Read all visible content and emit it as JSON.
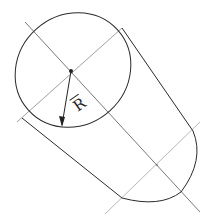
{
  "diagram": {
    "title": "",
    "shape": "cylinder",
    "labels": {
      "radius": "R"
    },
    "colors": {
      "stroke": "#2a2a2a",
      "centerline": "#8a8a8a",
      "background": "#ffffff"
    }
  }
}
